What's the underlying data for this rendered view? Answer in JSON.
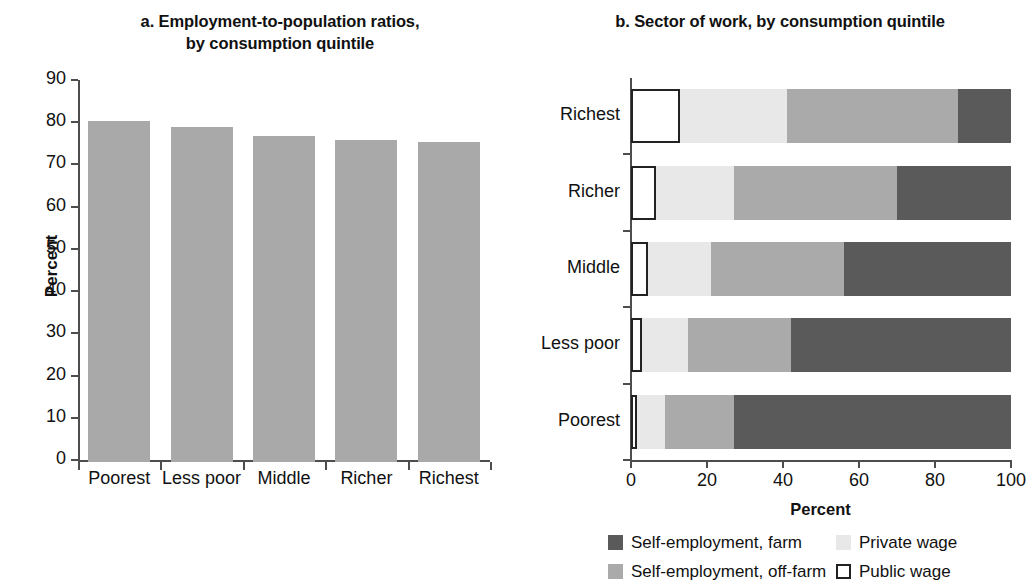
{
  "panel_a": {
    "title": "a. Employment-to-population ratios,\nby consumption quintile",
    "title_line1": "a. Employment-to-population ratios,",
    "title_line2": "by consumption quintile",
    "ylabel": "Percent"
  },
  "panel_b": {
    "title": "b. Sector of work, by consumption quintile",
    "xlabel": "Percent"
  },
  "legend": [
    {
      "label": "Self-employment, farm",
      "color": "#5a5a5a",
      "style": "filled"
    },
    {
      "label": "Private wage",
      "color": "#e8e8e8",
      "style": "filled"
    },
    {
      "label": "Self-employment, off-farm",
      "color": "#aaaaaa",
      "style": "filled"
    },
    {
      "label": "Public wage",
      "color": "#ffffff",
      "style": "outline"
    }
  ],
  "colors": {
    "bar_gray": "#a9a9a9",
    "farm": "#5a5a5a",
    "off_farm": "#aaaaaa",
    "private_wage": "#e8e8e8",
    "public_wage": "#ffffff",
    "axis": "#4d4d4d",
    "text": "#111111"
  },
  "chart_data": [
    {
      "type": "bar",
      "panel": "a",
      "title": "a. Employment-to-population ratios, by consumption quintile",
      "xlabel": "",
      "ylabel": "Percent",
      "ylim": [
        0,
        90
      ],
      "yticks": [
        0,
        10,
        20,
        30,
        40,
        50,
        60,
        70,
        80,
        90
      ],
      "grid": false,
      "legend_position": "none",
      "categories": [
        "Poorest",
        "Less poor",
        "Middle",
        "Richer",
        "Richest"
      ],
      "values": [
        80.8,
        79.3,
        77.3,
        76.2,
        75.9
      ]
    },
    {
      "type": "bar",
      "orientation": "horizontal",
      "stacked": true,
      "panel": "b",
      "title": "b. Sector of work, by consumption quintile",
      "xlabel": "Percent",
      "ylabel": "",
      "xlim": [
        0,
        100
      ],
      "xticks": [
        0,
        20,
        40,
        60,
        80,
        100
      ],
      "grid": false,
      "legend_position": "bottom",
      "categories": [
        "Richest",
        "Richer",
        "Middle",
        "Less poor",
        "Poorest"
      ],
      "series": [
        {
          "name": "Public wage",
          "color": "#ffffff",
          "values": [
            13.0,
            6.5,
            4.5,
            3.0,
            1.5
          ]
        },
        {
          "name": "Private wage",
          "color": "#e8e8e8",
          "values": [
            28.0,
            20.5,
            16.5,
            12.0,
            7.5
          ]
        },
        {
          "name": "Self-employment, off-farm",
          "color": "#aaaaaa",
          "values": [
            45.0,
            43.0,
            35.0,
            27.0,
            18.0
          ]
        },
        {
          "name": "Self-employment, farm",
          "color": "#5a5a5a",
          "values": [
            14.0,
            30.0,
            44.0,
            58.0,
            73.0
          ]
        }
      ]
    }
  ]
}
